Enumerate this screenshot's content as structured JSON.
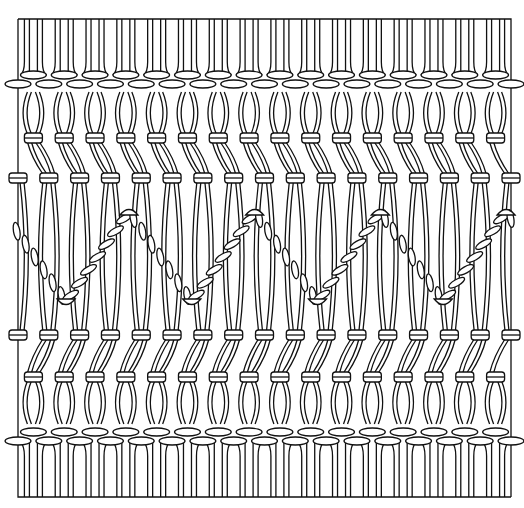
{
  "illustration": {
    "subject": "macrame-panel",
    "description": "Line drawing of a macrame panel with alternating square-knot rows and a zig-zag twisted cord band",
    "cord_columns": 16,
    "zigzag_peaks": 4,
    "ink_color": "#111111",
    "paper_color": "#ffffff"
  }
}
